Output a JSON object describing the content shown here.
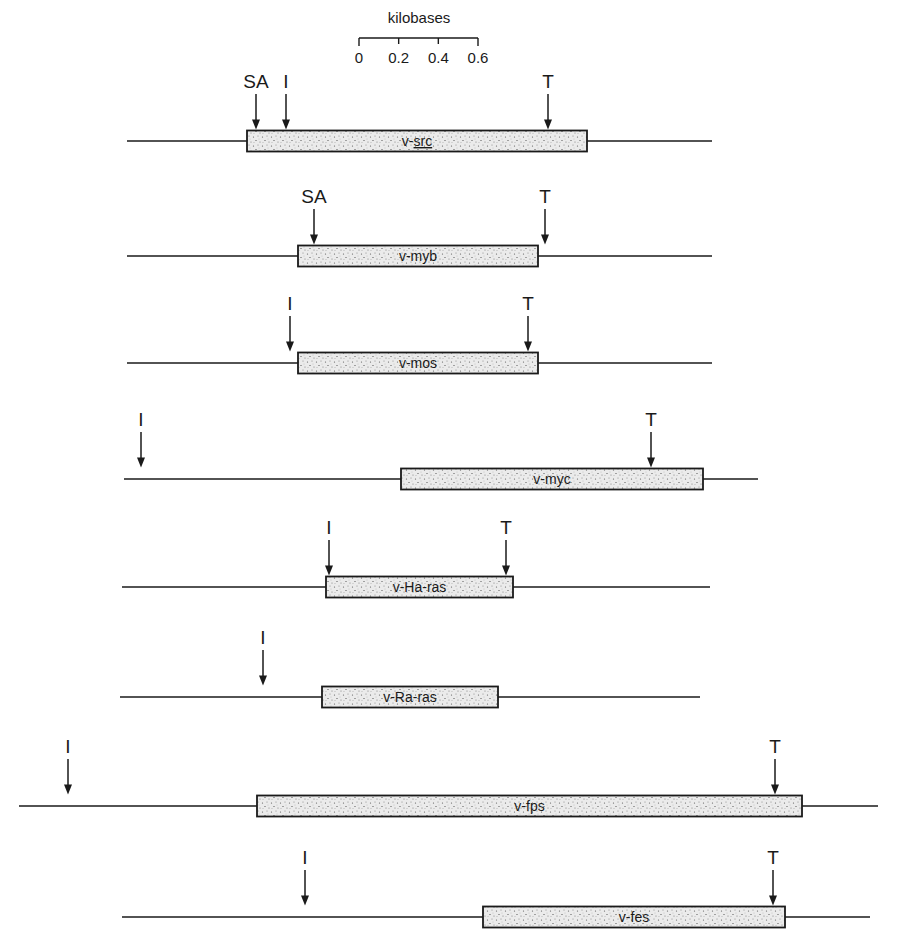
{
  "figure": {
    "stipple_fill": "#e6e6e6",
    "line_color": "#1a1a1a"
  },
  "scale_bar": {
    "title": "kilobases",
    "ticks": [
      "0",
      "0.2",
      "0.4",
      "0.6"
    ],
    "x_start": 359,
    "x_end": 478,
    "y": 38
  },
  "legend": {
    "SA": "splice acceptor",
    "I": "initiation codon",
    "T": "termination codon"
  },
  "genes": [
    {
      "name": "v-src",
      "name_prefix": "v-",
      "name_root": "src",
      "underlined": true,
      "line": [
        127,
        712
      ],
      "box": [
        247,
        587
      ],
      "y": 141,
      "markers": [
        {
          "label": "SA",
          "x": 256
        },
        {
          "label": "I",
          "x": 286
        },
        {
          "label": "T",
          "x": 548
        }
      ]
    },
    {
      "name": "v-myb",
      "name_prefix": "v-",
      "name_root": "myb",
      "underlined": false,
      "line": [
        127,
        712
      ],
      "box": [
        298,
        538
      ],
      "y": 256,
      "markers": [
        {
          "label": "SA",
          "x": 314
        },
        {
          "label": "T",
          "x": 545
        }
      ]
    },
    {
      "name": "v-mos",
      "name_prefix": "v-",
      "name_root": "mos",
      "underlined": false,
      "line": [
        127,
        712
      ],
      "box": [
        298,
        538
      ],
      "y": 363,
      "markers": [
        {
          "label": "I",
          "x": 290
        },
        {
          "label": "T",
          "x": 528
        }
      ]
    },
    {
      "name": "v-myc",
      "name_prefix": "v-",
      "name_root": "myc",
      "underlined": false,
      "line": [
        124,
        758
      ],
      "box": [
        401,
        703
      ],
      "y": 479,
      "markers": [
        {
          "label": "I",
          "x": 141
        },
        {
          "label": "T",
          "x": 651
        }
      ]
    },
    {
      "name": "v-Ha-ras",
      "name_prefix": "v-",
      "name_root": "Ha-ras",
      "underlined": false,
      "line": [
        122,
        710
      ],
      "box": [
        326,
        513
      ],
      "y": 587,
      "markers": [
        {
          "label": "I",
          "x": 329
        },
        {
          "label": "T",
          "x": 506
        }
      ]
    },
    {
      "name": "v-Ra-ras",
      "name_prefix": "v-",
      "name_root": "Ra-ras",
      "underlined": false,
      "line": [
        120,
        700
      ],
      "box": [
        322,
        498
      ],
      "y": 697,
      "markers": [
        {
          "label": "I",
          "x": 263
        }
      ]
    },
    {
      "name": "v-fps",
      "name_prefix": "v-",
      "name_root": "fps",
      "underlined": false,
      "line": [
        19,
        878
      ],
      "box": [
        257,
        802
      ],
      "y": 806,
      "markers": [
        {
          "label": "I",
          "x": 68
        },
        {
          "label": "T",
          "x": 775
        }
      ]
    },
    {
      "name": "v-fes",
      "name_prefix": "v-",
      "name_root": "fes",
      "underlined": false,
      "line": [
        122,
        870
      ],
      "box": [
        483,
        785
      ],
      "y": 917,
      "markers": [
        {
          "label": "I",
          "x": 305
        },
        {
          "label": "T",
          "x": 773
        }
      ]
    }
  ]
}
